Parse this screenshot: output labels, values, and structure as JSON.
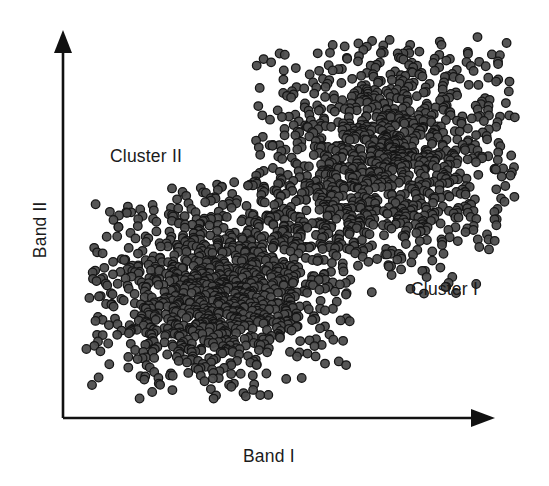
{
  "figure": {
    "width": 549,
    "height": 486,
    "background_color": "#ffffff"
  },
  "axes": {
    "x_label": "Band I",
    "y_label": "Band II",
    "origin_x": 63,
    "origin_y": 418,
    "x_end": 492,
    "y_top": 36,
    "line_color": "#111111",
    "arrowheads": "filled-triangle",
    "ticks": "none",
    "gridlines": "none"
  },
  "annotations": [
    {
      "name": "cluster-ii-label",
      "text": "Cluster II",
      "x": 110,
      "y": 148
    },
    {
      "name": "cluster-i-label",
      "text": "Cluster I",
      "x": 411,
      "y": 281
    }
  ],
  "marker_style": {
    "shape": "circle",
    "radius": 4.3,
    "fill_color": "#4d4d4d",
    "stroke_color": "#151515",
    "stroke_width": 1.25,
    "fill_opacity": 0.95
  },
  "chart_data": {
    "type": "scatter",
    "title": "",
    "xlabel": "Band I",
    "ylabel": "Band II",
    "xlim": [
      0,
      1
    ],
    "ylim": [
      0,
      1
    ],
    "grid": false,
    "legend": "none",
    "axis_ticks": false,
    "series": [
      {
        "name": "Cluster I",
        "label_position": "right-of-cloud",
        "n_points": 1150,
        "center_px": [
          385,
          160
        ],
        "spread_px": [
          68,
          58
        ],
        "rotation_deg": -18,
        "bbox_px": [
          255,
          37,
          516,
          296
        ],
        "color": "#4d4d4d"
      },
      {
        "name": "Cluster II",
        "label_position": "above-left-of-cloud",
        "n_points": 1150,
        "center_px": [
          218,
          293
        ],
        "spread_px": [
          62,
          50
        ],
        "rotation_deg": -18,
        "bbox_px": [
          86,
          182,
          352,
          399
        ],
        "color": "#4d4d4d"
      }
    ]
  }
}
